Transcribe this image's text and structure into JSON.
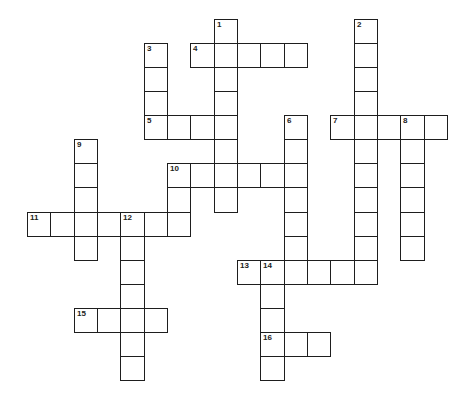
{
  "puzzle": {
    "type": "crossword",
    "grid": {
      "origin_x": 27,
      "origin_y": 19,
      "cell_width": 23.33,
      "cell_height": 24.07,
      "columns": 18,
      "rows": 15
    },
    "colors": {
      "background": "#ffffff",
      "border": "#1e1e1e",
      "number": "#222222"
    },
    "entries": [
      {
        "number": "1",
        "direction": "down",
        "col": 8,
        "row": 0,
        "length": 8
      },
      {
        "number": "2",
        "direction": "down",
        "col": 14,
        "row": 0,
        "length": 11
      },
      {
        "number": "3",
        "direction": "down",
        "col": 5,
        "row": 1,
        "length": 4
      },
      {
        "number": "4",
        "direction": "across",
        "col": 7,
        "row": 1,
        "length": 5
      },
      {
        "number": "5",
        "direction": "across",
        "col": 5,
        "row": 4,
        "length": 4
      },
      {
        "number": "6",
        "direction": "down",
        "col": 11,
        "row": 4,
        "length": 7
      },
      {
        "number": "7",
        "direction": "across",
        "col": 13,
        "row": 4,
        "length": 5
      },
      {
        "number": "8",
        "direction": "down",
        "col": 16,
        "row": 4,
        "length": 6
      },
      {
        "number": "9",
        "direction": "down",
        "col": 2,
        "row": 5,
        "length": 5
      },
      {
        "number": "10",
        "direction": "across",
        "col": 6,
        "row": 6,
        "length": 6
      },
      {
        "number": "10",
        "direction": "down",
        "col": 6,
        "row": 6,
        "length": 3
      },
      {
        "number": "11",
        "direction": "across",
        "col": 0,
        "row": 8,
        "length": 7
      },
      {
        "number": "12",
        "direction": "down",
        "col": 4,
        "row": 8,
        "length": 7
      },
      {
        "number": "13",
        "direction": "across",
        "col": 9,
        "row": 10,
        "length": 6
      },
      {
        "number": "14",
        "direction": "down",
        "col": 10,
        "row": 10,
        "length": 5
      },
      {
        "number": "15",
        "direction": "across",
        "col": 2,
        "row": 12,
        "length": 4
      },
      {
        "number": "16",
        "direction": "across",
        "col": 10,
        "row": 13,
        "length": 3
      }
    ]
  }
}
